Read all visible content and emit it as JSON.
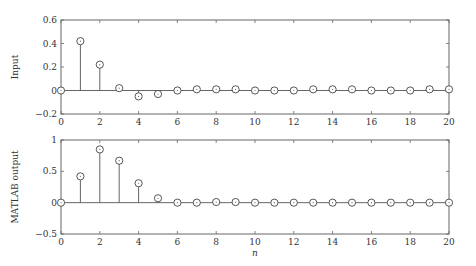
{
  "chart_data": [
    {
      "type": "stem",
      "title": "",
      "xlabel": "",
      "ylabel": "Input",
      "x": [
        0,
        1,
        2,
        3,
        4,
        5,
        6,
        7,
        8,
        9,
        10,
        11,
        12,
        13,
        14,
        15,
        16,
        17,
        18,
        19,
        20
      ],
      "values": [
        0,
        0.42,
        0.22,
        0.02,
        -0.05,
        -0.03,
        0,
        0.01,
        0.01,
        0.01,
        0,
        0,
        0,
        0.01,
        0.01,
        0.01,
        0,
        0,
        0,
        0.01,
        0.01
      ],
      "xlim": [
        0,
        20
      ],
      "ylim": [
        -0.2,
        0.6
      ],
      "xticks": [
        "0",
        "2",
        "4",
        "6",
        "8",
        "10",
        "12",
        "14",
        "16",
        "18",
        "20"
      ],
      "yticks": [
        "−0.2",
        "0",
        "0.2",
        "0.4",
        "0.6"
      ],
      "grid": false
    },
    {
      "type": "stem",
      "title": "",
      "xlabel": "n",
      "ylabel": "MATLAB output",
      "x": [
        0,
        1,
        2,
        3,
        4,
        5,
        6,
        7,
        8,
        9,
        10,
        11,
        12,
        13,
        14,
        15,
        16,
        17,
        18,
        19,
        20
      ],
      "values": [
        0,
        0.42,
        0.85,
        0.67,
        0.31,
        0.07,
        0,
        0,
        0.01,
        0.01,
        0,
        0,
        0,
        0,
        0,
        0,
        0,
        0,
        0,
        0,
        0
      ],
      "xlim": [
        0,
        20
      ],
      "ylim": [
        -0.5,
        1
      ],
      "xticks": [
        "0",
        "2",
        "4",
        "6",
        "8",
        "10",
        "12",
        "14",
        "16",
        "18",
        "20"
      ],
      "yticks": [
        "−0.5",
        "0",
        "0.5",
        "1"
      ],
      "grid": false
    }
  ]
}
